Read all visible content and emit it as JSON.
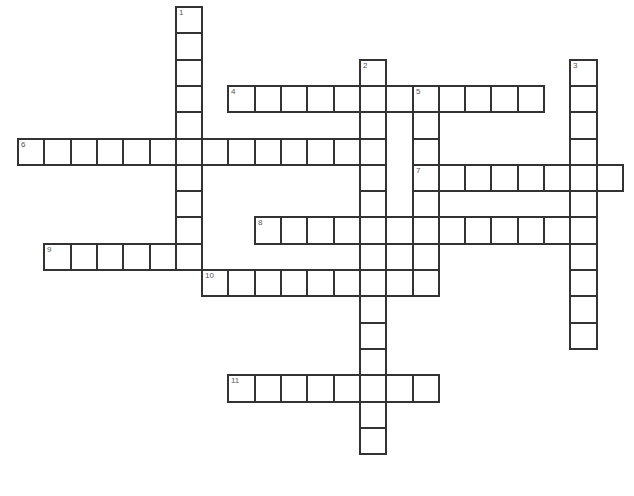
{
  "puzzle": {
    "cell_size": 26.3,
    "origin_x": 18,
    "origin_y": 7,
    "line_color": "#333333",
    "words": [
      {
        "number": "1",
        "direction": "down",
        "col": 6,
        "row": 0,
        "length": 10
      },
      {
        "number": "2",
        "direction": "down",
        "col": 13,
        "row": 2,
        "length": 15
      },
      {
        "number": "3",
        "direction": "down",
        "col": 21,
        "row": 2,
        "length": 11
      },
      {
        "number": "4",
        "direction": "across",
        "col": 8,
        "row": 3,
        "length": 12
      },
      {
        "number": "5",
        "direction": "down",
        "col": 15,
        "row": 3,
        "length": 8
      },
      {
        "number": "6",
        "direction": "across",
        "col": 0,
        "row": 5,
        "length": 14
      },
      {
        "number": "7",
        "direction": "across",
        "col": 15,
        "row": 6,
        "length": 8
      },
      {
        "number": "8",
        "direction": "across",
        "col": 9,
        "row": 8,
        "length": 13
      },
      {
        "number": "9",
        "direction": "across",
        "col": 1,
        "row": 9,
        "length": 6
      },
      {
        "number": "10",
        "direction": "across",
        "col": 7,
        "row": 10,
        "length": 9
      },
      {
        "number": "11",
        "direction": "across",
        "col": 8,
        "row": 14,
        "length": 8
      }
    ]
  }
}
